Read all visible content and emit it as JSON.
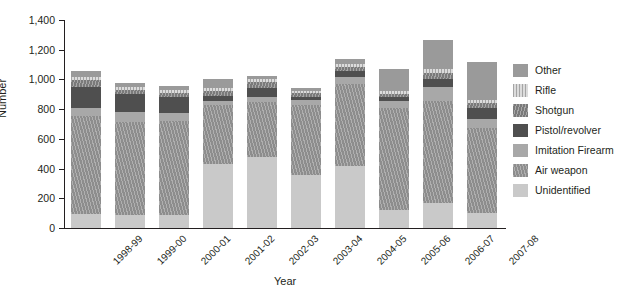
{
  "chart_data": {
    "type": "bar",
    "stacked": true,
    "title": "",
    "xlabel": "Year",
    "ylabel": "Number",
    "ylim": [
      0,
      1400
    ],
    "ytick_values": [
      0,
      200,
      400,
      600,
      800,
      1000,
      1200,
      1400
    ],
    "ytick_labels": [
      "0",
      "200",
      "400",
      "600",
      "800",
      "1,000",
      "1,200",
      "1,400"
    ],
    "grid": false,
    "legend_position": "right",
    "categories": [
      "1998-99",
      "1999-00",
      "2000-01",
      "2001-02",
      "2002-03",
      "2003-04",
      "2004-05",
      "2005-06",
      "2006-07",
      "2007-08"
    ],
    "series": [
      {
        "name": "Unidentified",
        "color": "#c9c9c9",
        "pattern": "solid",
        "values": [
          95,
          90,
          85,
          430,
          480,
          360,
          415,
          120,
          170,
          100
        ]
      },
      {
        "name": "Air weapon",
        "color": "#8d8d8d",
        "pattern": "hatch",
        "values": [
          660,
          625,
          635,
          395,
          365,
          470,
          555,
          690,
          685,
          575
        ]
      },
      {
        "name": "Imitation Firearm",
        "color": "#a8a8a8",
        "pattern": "solid",
        "values": [
          50,
          65,
          55,
          30,
          40,
          35,
          45,
          45,
          95,
          60
        ]
      },
      {
        "name": "Pistol/revolver",
        "color": "#4f4f4f",
        "pattern": "solid",
        "values": [
          145,
          120,
          110,
          35,
          60,
          20,
          40,
          25,
          55,
          70
        ]
      },
      {
        "name": "Shotgun",
        "color": "#7a7a7a",
        "pattern": "hatch",
        "values": [
          45,
          30,
          25,
          30,
          35,
          25,
          30,
          25,
          40,
          35
        ]
      },
      {
        "name": "Rifle",
        "color": "#dcdcdc",
        "pattern": "vhatch",
        "values": [
          20,
          20,
          20,
          20,
          20,
          15,
          20,
          15,
          25,
          20
        ]
      },
      {
        "name": "Other",
        "color": "#9a9a9a",
        "pattern": "solid",
        "values": [
          40,
          25,
          25,
          65,
          25,
          20,
          35,
          150,
          195,
          260
        ]
      }
    ],
    "totals": [
      1055,
      975,
      955,
      1005,
      1025,
      945,
      1140,
      1070,
      1265,
      1120
    ]
  },
  "legend": {
    "items": [
      {
        "label": "Other",
        "color": "#9a9a9a",
        "pattern": "solid"
      },
      {
        "label": "Rifle",
        "color": "#dcdcdc",
        "pattern": "vhatch"
      },
      {
        "label": "Shotgun",
        "color": "#7a7a7a",
        "pattern": "hatch"
      },
      {
        "label": "Pistol/revolver",
        "color": "#4f4f4f",
        "pattern": "solid"
      },
      {
        "label": "Imitation Firearm",
        "color": "#a8a8a8",
        "pattern": "solid"
      },
      {
        "label": "Air weapon",
        "color": "#8d8d8d",
        "pattern": "hatch"
      },
      {
        "label": "Unidentified",
        "color": "#c9c9c9",
        "pattern": "solid"
      }
    ]
  }
}
